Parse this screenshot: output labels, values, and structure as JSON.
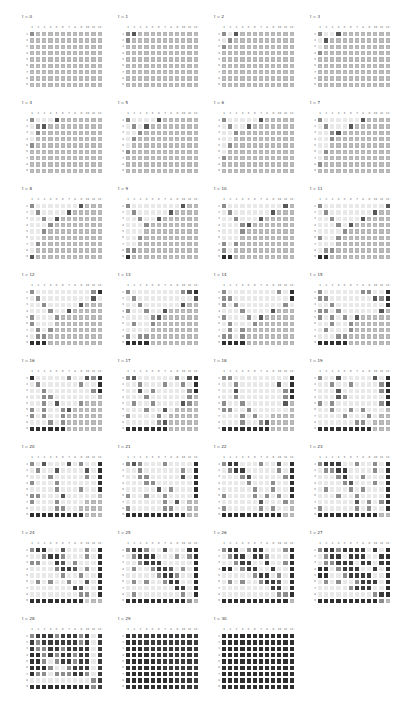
{
  "chart_data": {
    "type": "heatmap",
    "title": "",
    "rows": [
      "1",
      "2",
      "3",
      "4",
      "5",
      "6",
      "7",
      "8",
      "9"
    ],
    "columns": [
      "1",
      "2",
      "3",
      "4",
      "5",
      "6",
      "7",
      "8",
      "9",
      "10",
      "11",
      "12"
    ],
    "legend": {
      "u": {
        "meaning": "unfilled (infinity)",
        "label": "∞",
        "color": "#b4b4b4"
      },
      "w": {
        "meaning": "filled, light",
        "label": "·",
        "color": "#e9e9e9"
      },
      "l": {
        "meaning": "filled, light-mid",
        "label": "·",
        "color": "#cdcdcd"
      },
      "m": {
        "meaning": "mid",
        "label": "",
        "color": "#8d8d8d"
      },
      "d": {
        "meaning": "dark",
        "label": "",
        "color": "#575757"
      },
      "k": {
        "meaning": "very dark / final",
        "label": "",
        "color": "#2f2f2f"
      },
      "K": {
        "meaning": "dark with value",
        "label": "·",
        "color": "#3b3b3b"
      }
    },
    "panels": [
      {
        "title": "t = 0",
        "grid": [
          "muuuuuuuuuuu",
          "uuuuuuuuuuuu",
          "uuuuuuuuuuuu",
          "uuuuuuuuuuuu",
          "uuuuuuuuuuuu",
          "uuuuuuuuuuuu",
          "uuuuuuuuuuuu",
          "uuuuuuuuuuuu",
          "uuuuuuuuuuuu"
        ]
      },
      {
        "title": "t = 1",
        "grid": [
          "mduuuuuuuuuu",
          "muuuuuuuuuuu",
          "uuuuuuuuuuuu",
          "uuuuuuuuuuuu",
          "uuuuuuuuuuuu",
          "uuuuuuuuuuuu",
          "uuuuuuuuuuuu",
          "uuuuuuuuuuuu",
          "uuuuuuuuuuuu"
        ]
      },
      {
        "title": "t = 2",
        "grid": [
          "mwduuuuuuuuu",
          "wmuuuuuuuuuu",
          "muuuuuuuuuuu",
          "uuuuuuuuuuuu",
          "uuuuuuuuuuuu",
          "uuuuuuuuuuuu",
          "uuuuuuuuuuuu",
          "uuuuuuuuuuuu",
          "uuuuuuuuuuuu"
        ]
      },
      {
        "title": "t = 3",
        "grid": [
          "mwwduuuuuuuu",
          "wduuuuuuuuuu",
          "wuuuuuuuuuuu",
          "muuuuuuuuuuu",
          "uuuuuuuuuuuu",
          "uuuuuuuuuuuu",
          "uuuuuuuuuuuu",
          "uuuuuuuuuuuu",
          "uuuuuuuuuuuu"
        ]
      },
      {
        "title": "t = 4",
        "grid": [
          "mwwwduuuuuuu",
          "wmduuuuuuuuu",
          "wmuuuuuuuuuu",
          "wuuuuuuuuuuu",
          "muuuuuuuuuuu",
          "uuuuuuuuuuuu",
          "uuuuuuuuuuuu",
          "uuuuuuuuuuuu",
          "uuuuuuuuuuuu"
        ]
      },
      {
        "title": "t = 5",
        "grid": [
          "mwwwwduuuuuu",
          "wmwduuuuuuuu",
          "wwmuuuuuuuuu",
          "wmuuuuuuuuuu",
          "wuuuuuuuuuuu",
          "muuuuuuuuuuu",
          "uuuuuuuuuuuu",
          "uuuuuuuuuuuu",
          "uuuuuuuuuuuu"
        ]
      },
      {
        "title": "t = 6",
        "grid": [
          "mwwwwwduuuuu",
          "wmwwduuuuuuu",
          "wwmuuuuuuuuu",
          "wwuuuuuuuuuu",
          "wmuuuuuuuuuu",
          "wuuuuuuuuuuu",
          "muuuuuuuuuuu",
          "uuuuuuuuuuuu",
          "uuuuuuuuuuuu"
        ]
      },
      {
        "title": "t = 7",
        "grid": [
          "mwwwwwwduuuu",
          "wmwwwduuuuuu",
          "wwmduuuuuuuu",
          "wwmuuuuuuuuu",
          "wwuuuuuuuuuu",
          "wmuuuuuuuuuu",
          "wuuuuuuuuuuu",
          "muuuuuuuuuuu",
          "uuuuuuuuuuuu"
        ]
      },
      {
        "title": "t = 8",
        "grid": [
          "mwwwwwwwduuu",
          "wmwwwwduuuuu",
          "wwmwduuuuuuu",
          "wwwmuuuuuuuu",
          "wwmuuuuuuuuu",
          "wwuuuuuuuuuu",
          "wmuuuuuuuuuu",
          "wuuuuuuuuuuu",
          "duuuuuuuuuuu"
        ]
      },
      {
        "title": "t = 9",
        "grid": [
          "mwwwwwwwwduu",
          "wmwwwwwduuuu",
          "wwmwwduuuuuu",
          "wwwmuuuuuuuu",
          "wwwuuuuuuuuu",
          "wwmuuuuuuuuu",
          "wwuuuuuuuuuu",
          "mmuuuuuuuuuu",
          "kuuuuuuuuuuu"
        ]
      },
      {
        "title": "t = 10",
        "grid": [
          "mwwwwwwwwwdu",
          "wmwwwwwwduuu",
          "wwmwwwduuuuu",
          "wwwmduuuuuuu",
          "wwwmuuuuuuuu",
          "wwwuuuuuuuuu",
          "mwmuuuuuuuuu",
          "mwuuuuuuuuuu",
          "kkuuuuuuuuuu"
        ]
      },
      {
        "title": "t = 11",
        "grid": [
          "mwwwwwwwwwwd",
          "wmwwwwwwwduu",
          "wwmwwwwduuuu",
          "wwwmwduuuuuu",
          "wwwwmuuuuuuu",
          "mwwmuuuuuuuu",
          "wwwuuuuuuuuu",
          "wmmuuuuuuuuu",
          "kkuuuuuuuuuu"
        ]
      },
      {
        "title": "t = 12",
        "grid": [
          "mwwwwwwwwwmk",
          "wmwwwwwwwwdw",
          "wwmwwwwwduuu",
          "wwwmwwduuuuu",
          "mwwwmuuuuuuu",
          "mwwwuuuuuuuu",
          "wmwmuuuuuuuu",
          "wmmuuuuuuuuu",
          "kkkuuuuuuuuu"
        ]
      },
      {
        "title": "t = 13",
        "grid": [
          "mwwwwwwwwmdk",
          "wmwwwwwwwwwd",
          "wwmwwwwwwduu",
          "mwwmwwduuuuu",
          "wwwwmduuuuuu",
          "wmwwmuuuuuuu",
          "wwwwuuuuuuuu",
          "mwmmuuuuuuuu",
          "kkkkuuuuuuuu"
        ]
      },
      {
        "title": "t = 14",
        "grid": [
          "mwwwwwwwwmwk",
          "mmwwwwwwwwwk",
          "mwmwwwwwwwmw",
          "wwwmwwwwduuu",
          "mwwwmwduuuuu",
          "wmwwwmuuuuuu",
          "wmwmuuuuuuuu",
          "mmwmuuuuuuuu",
          "kkkkuuuuuuuu"
        ]
      },
      {
        "title": "t = 15",
        "grid": [
          "mwwwwwwmmwwk",
          "mmwwwwwwwdmk",
          "wwmwwwwwwwwk",
          "mmwmwwwwwwdu",
          "mwmwmwduuuuu",
          "wwmwwmuuuuuu",
          "wmwwwmuuuuuu",
          "wwwmmuuuuuuu",
          "kkkkkuuuuuuu"
        ]
      },
      {
        "title": "t = 16",
        "grid": [
          "kwwwwwmwwdmk",
          "wmwwwwwwmwwk",
          "wwmwwwwwwwmk",
          "wwmmwwwwwwwu",
          "wwmwdwwwmuuu",
          "mwmwwmduuuuu",
          "mwmwwmuuuuuu",
          "wwwmwmuuuuuu",
          "kkkkkkuuuuuu"
        ]
      },
      {
        "title": "t = 17",
        "grid": [
          "mdwwwwwwmwdk",
          "wwmwwwmwwmwk",
          "wwdwmwwwwwmk",
          "wwwmwwwwwwmu",
          "wmwwmwwwwdmu",
          "wwwmwwdwuuuu",
          "mwwwwmwuuuuu",
          "wwwwwmduuuuu",
          "kkkkkkkuuuuu"
        ]
      },
      {
        "title": "t = 18",
        "grid": [
          "mmwwwwwwwwwk",
          "wwmwwwwwwdwk",
          "wwdwwwwwwwmk",
          "wwmwwwwwwwmk",
          "mwwmwwwwwwdu",
          "mmwwmwwwwwwu",
          "wwwmwmwwuuuu",
          "wwwmwwmduuuu",
          "kkkkkkkkuuuu"
        ]
      },
      {
        "title": "t = 19",
        "grid": [
          "mwwdwwwwwdwk",
          "wwmwwmwwwwmk",
          "wwwdwwwwwwmk",
          "wwwdmwwwwwwk",
          "mwmwwwwwwwmk",
          "wwmwwmwmwwwu",
          "wwwwmwwwmwuu",
          "wwwwwwmmwuuu",
          "kkkkkkkkkuuu"
        ]
      },
      {
        "title": "t = 20",
        "grid": [
          "mwdwwwdwmwwk",
          "wmwwdwwwwdwk",
          "wwwmwwwwwmwk",
          "mwwwmwwwwwwk",
          "wwwwmwwwmwwk",
          "mmwwwdwwwwwu",
          "mwwwmwwwwuuu",
          "wwwwmmwwuuuu",
          "kkkkkkkkkuuu"
        ]
      },
      {
        "title": "t = 21",
        "grid": [
          "mdmwwwmwwwwk",
          "wwmwwwwwwmwk",
          "wwmmwwwwwdwk",
          "wwwmmwwwwwwk",
          "wwwwwdwmwwwk",
          "mwwmwwmwwwwk",
          "wwwwwwmwdwuu",
          "mwwwwwmmwwuu",
          "kkkkkkkkkkuu"
        ]
      },
      {
        "title": "t = 22",
        "grid": [
          "mKKwwwmwwdwk",
          "wmKKwwwwwmwk",
          "wwwmdwwwwwmk",
          "wwwwmwwwmwwk",
          "wwwwwmwwmwwk",
          "mwwwwmwmwmwk",
          "wwwwwwdwwwmu",
          "mwwwwwmwmwwu",
          "kkkkkkkkkkuu"
        ]
      },
      {
        "title": "t = 23",
        "grid": [
          "mKKKwwmwwmwk",
          "wmmKKwwwwmwk",
          "wwwmKwwmwwwk",
          "wwwwmdwwwmwk",
          "wmwwwmwmwwwk",
          "wwwmwwmwwwwk",
          "wwwwwwdwmwmk",
          "mwwwwwmwmwwk",
          "kkkkkkkkkkuu"
        ]
      },
      {
        "title": "t = 24",
        "grid": [
          "mKKwwdwwwmwk",
          "wwmKKmwwwmwk",
          "mmwwKdwmwwwk",
          "wwwwmKKdwmwk",
          "wwwwwmwwmwwk",
          "wmwmwwmwwdwk",
          "wwwwwwwKdwwk",
          "wwwwwwwwmmwk",
          "kkkkkkkkkluu"
        ]
      },
      {
        "title": "t = 25",
        "grid": [
          "mKKmwwdwwwKk",
          "wmKKKwwwmwmk",
          "wwmKKKwwwwwk",
          "wmwwmKKdwmwk",
          "wwwwwmKKmwwk",
          "wmwmwwmKKwwk",
          "wwwwwwwwKKwk",
          "wmwwwwwwwmwk",
          "kkkkkkkkkkmu"
        ]
      },
      {
        "title": "t = 26",
        "grid": [
          "mKKwmKKwwwmk",
          "wmKKwKKmwwwk",
          "wwmKKwwKwwmk",
          "kkwmKKwwKwwk",
          "wwwwwmKKwmwk",
          "wmwmwwmKKdwk",
          "wwwwwwwwKKwk",
          "wwwwwwwwwmmk",
          "kkkkkkkkkkku"
        ]
      },
      {
        "title": "t = 27",
        "grid": [
          "mKKmKKKKwKwk",
          "wmKKwKKKwwKk",
          "wmmKKKwKKwKk",
          "kkwmKKKwwKwk",
          "kkwwmKKKKwwk",
          "wmwmwwmKKKwk",
          "wwwwwmKKKwwk",
          "wwwwwwwwwmKk",
          "kkkkkkkkkkmu"
        ]
      },
      {
        "title": "t = 28",
        "grid": [
          "mKKKmKKKmKwK",
          "KmKKKKKKmKwK",
          "KmmKKmKKKKwK",
          "kkmKmKKmKKwK",
          "kkmwmKKmKKwK",
          "kkkmwwmKKKwK",
          "kmmwmmmKKmwK",
          "wwwwwwwwwwmK",
          "kkkkkkkkkkmK"
        ]
      },
      {
        "title": "t = 29",
        "grid": [
          "kKKKKKKKKKKK",
          "kkKKKKKKKKKK",
          "kkkKKKKKKKKK",
          "kkkkKKKKKKKK",
          "kkkkkKKKKKKK",
          "kkkkkkKKKKKK",
          "kkkkkkkKKKKK",
          "kkkkkkkkKKKK",
          "kkkkkkkkkKKK"
        ]
      },
      {
        "title": "t = 30",
        "grid": [
          "kkkkkkkkkkkk",
          "kkkkkkkkkkkk",
          "kkkkkkkkkkkk",
          "kkkkkkkkkkkk",
          "kkkkkkkkkkkk",
          "kkkkkkkkkkkk",
          "kkkkkkkkkkkk",
          "kkkkkkkkkkkk",
          "kkkkkkkkkkkk"
        ]
      }
    ]
  }
}
